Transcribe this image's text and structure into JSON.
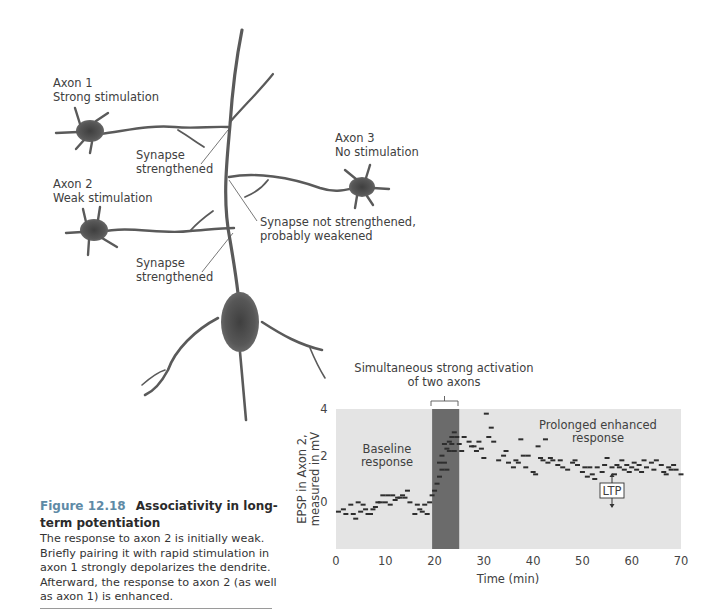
{
  "diagram": {
    "axon1": {
      "line1": "Axon 1",
      "line2": "Strong stimulation"
    },
    "axon2": {
      "line1": "Axon 2",
      "line2": "Weak stimulation"
    },
    "axon3": {
      "line1": "Axon 3",
      "line2": "No stimulation"
    },
    "synapse_upper": {
      "line1": "Synapse",
      "line2": "strengthened"
    },
    "synapse_lower": {
      "line1": "Synapse",
      "line2": "strengthened"
    },
    "synapse_axon3": {
      "line1": "Synapse not strengthened,",
      "line2": "probably weakened"
    }
  },
  "caption": {
    "figure_number": "Figure 12.18",
    "title": "Associativity in long-term potentiation",
    "body": "The response to axon 2 is initially weak. Briefly pairing it with rapid stimulation in axon 1 strongly depolarizes the dendrite. Afterward, the response to axon 2 (as well as axon 1) is enhanced."
  },
  "colors": {
    "plot_background": "#e4e4e4",
    "activation_band": "#6b6b6b",
    "marker": "#2e2e2e",
    "caption_accent": "#5e8aa6",
    "neuron": "#5a5a5a"
  },
  "chart_data": {
    "type": "scatter",
    "title": "",
    "xlabel": "Time (min)",
    "ylabel": "EPSP in Axon 2, measured in mV",
    "xlim": [
      0,
      70
    ],
    "ylim": [
      -2,
      4
    ],
    "xticks": [
      0,
      10,
      20,
      30,
      40,
      50,
      60,
      70
    ],
    "yticks": [
      0,
      2,
      4
    ],
    "grid": false,
    "legend": null,
    "marker": "short horizontal dash",
    "annotations": [
      {
        "text": "Simultaneous strong activation of two axons",
        "type": "bracket",
        "x_range": [
          19.5,
          25
        ]
      },
      {
        "text": "Baseline response",
        "x": 10.5,
        "y": 2
      },
      {
        "text": "Prolonged enhanced response",
        "x": 53,
        "y": 3.2
      },
      {
        "text": "LTP",
        "x": 56,
        "y": 0.7,
        "type": "double-arrow box"
      }
    ],
    "shaded_region": {
      "x_range": [
        19.5,
        25
      ],
      "label": "activation period"
    },
    "series": [
      {
        "name": "Baseline",
        "x": [
          0.5,
          1.5,
          2,
          3,
          3.5,
          4,
          4.5,
          5,
          5.5,
          6,
          6.5,
          7,
          7.5,
          8,
          8.5,
          9,
          9.5,
          10,
          10.5,
          11,
          11.5,
          12,
          12.5,
          13,
          13.5,
          14,
          14.5,
          15,
          16,
          16.5,
          17,
          17.5,
          18,
          18.5,
          19
        ],
        "y": [
          -0.4,
          -0.3,
          -0.5,
          -0.1,
          -0.5,
          -0.7,
          0,
          -0.4,
          -0.1,
          -0.3,
          -0.5,
          -0.5,
          -0.3,
          -0.2,
          0,
          0,
          0.3,
          0,
          0.3,
          -0.1,
          0.3,
          0.1,
          0.2,
          0.2,
          0.3,
          0.2,
          0.5,
          0,
          -0.5,
          -0.1,
          -0.3,
          -0.4,
          -0.1,
          -0.5,
          0
        ]
      },
      {
        "name": "During activation",
        "x": [
          19.5,
          20,
          20.5,
          21,
          21,
          21.5,
          21.5,
          22,
          22,
          22.5,
          22.5,
          23,
          23,
          23.5,
          23.5,
          24,
          24,
          24.5,
          25
        ],
        "y": [
          0.3,
          0.5,
          0.8,
          1.1,
          1.7,
          1.4,
          2.0,
          1.7,
          2.5,
          1.4,
          2.3,
          2.2,
          2.6,
          2.8,
          2.5,
          3.0,
          2.2,
          2.8,
          2.5
        ]
      },
      {
        "name": "Post activation",
        "x": [
          25.5,
          26,
          27,
          27.5,
          28,
          28.5,
          29,
          29.5,
          30,
          30.5,
          31,
          31.5,
          32,
          33,
          34,
          34.5,
          35,
          36,
          36.5,
          37,
          37.5,
          38,
          38.5,
          39,
          40,
          40.5,
          41,
          41.5,
          42,
          42.5,
          43,
          43.5,
          44,
          45,
          45.5,
          46,
          47,
          48,
          48.5,
          49,
          50,
          50.5,
          51,
          51.5,
          52,
          52.5,
          53,
          54,
          54.5,
          55,
          56,
          56.5,
          57,
          57.5,
          58,
          58.5,
          59,
          59.5,
          60,
          60.5,
          61,
          61.5,
          62,
          62.5,
          63,
          64,
          64.5,
          65,
          66,
          66.5,
          67,
          67.5,
          68,
          68.5,
          69,
          70
        ],
        "y": [
          2.2,
          2.8,
          2.6,
          2.4,
          2.4,
          2.2,
          2.6,
          2.3,
          1.9,
          3.8,
          2.8,
          3.2,
          2.6,
          1.8,
          2.0,
          2.2,
          1.7,
          1.5,
          1.8,
          1.7,
          2.7,
          2.0,
          1.5,
          2.0,
          1.3,
          1.2,
          2.4,
          1.9,
          1.8,
          2.7,
          1.7,
          1.9,
          1.8,
          1.6,
          1.8,
          1.5,
          1.4,
          1.7,
          1.8,
          1.6,
          1.3,
          1.5,
          1.1,
          1.5,
          1.2,
          1.0,
          1.5,
          1.3,
          1.6,
          1.9,
          1.5,
          1.2,
          1.6,
          1.5,
          1.8,
          1.4,
          1.6,
          1.3,
          1.5,
          1.7,
          1.4,
          1.6,
          1.3,
          1.8,
          1.5,
          1.7,
          1.4,
          1.8,
          1.6,
          1.3,
          1.2,
          1.5,
          1.4,
          1.6,
          1.4,
          1.2
        ]
      }
    ]
  }
}
